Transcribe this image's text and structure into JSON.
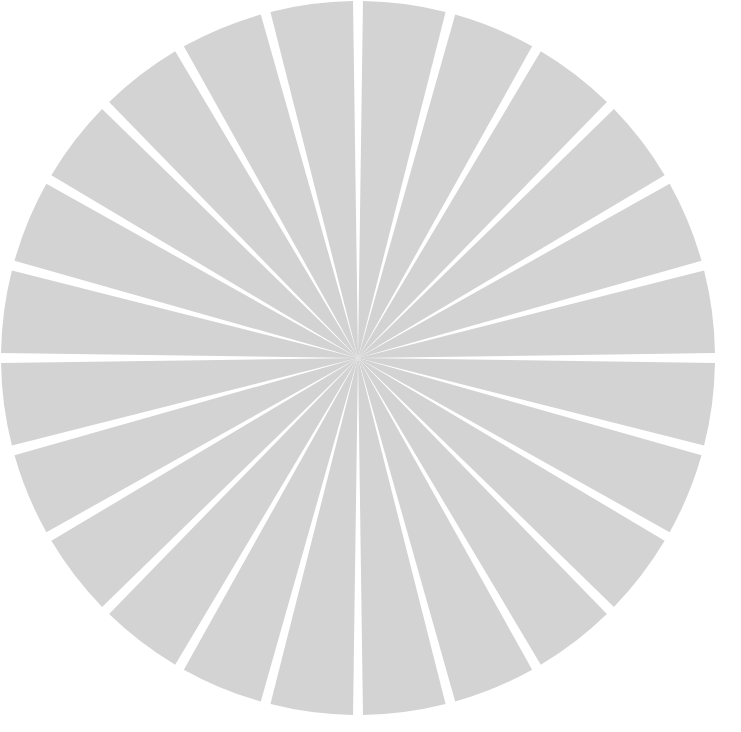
{
  "chart_data": {
    "type": "pie",
    "title": "",
    "subtitle": "",
    "xlabel": "",
    "ylabel": "",
    "grid": false,
    "legend": false,
    "legend_position": "none",
    "start_angle_deg": 90,
    "direction": "clockwise",
    "center_x": 358,
    "center_y": 358,
    "radius": 357,
    "wedge_gap_deg": 1.6,
    "slice_color": "#d3d3d3",
    "gap_color": "#ffffff",
    "background_color": "#ffffff",
    "categories": [
      "1",
      "2",
      "3",
      "4",
      "5",
      "6",
      "7",
      "8",
      "9",
      "10",
      "11",
      "12",
      "13",
      "14",
      "15",
      "16",
      "17",
      "18",
      "19",
      "20",
      "21",
      "22",
      "23",
      "24"
    ],
    "values": [
      4.17,
      4.17,
      4.17,
      4.17,
      4.17,
      4.17,
      4.17,
      4.17,
      4.17,
      4.17,
      4.17,
      4.17,
      4.17,
      4.17,
      4.17,
      4.17,
      4.17,
      4.17,
      4.17,
      4.17,
      4.17,
      4.17,
      4.17,
      4.17
    ],
    "colors": [
      "#d3d3d3",
      "#d3d3d3",
      "#d3d3d3",
      "#d3d3d3",
      "#d3d3d3",
      "#d3d3d3",
      "#d3d3d3",
      "#d3d3d3",
      "#d3d3d3",
      "#d3d3d3",
      "#d3d3d3",
      "#d3d3d3",
      "#d3d3d3",
      "#d3d3d3",
      "#d3d3d3",
      "#d3d3d3",
      "#d3d3d3",
      "#d3d3d3",
      "#d3d3d3",
      "#d3d3d3",
      "#d3d3d3",
      "#d3d3d3",
      "#d3d3d3",
      "#d3d3d3"
    ],
    "slice_count": 24,
    "total": 100,
    "annotations": [],
    "tick_labels": [],
    "data_labels": []
  }
}
